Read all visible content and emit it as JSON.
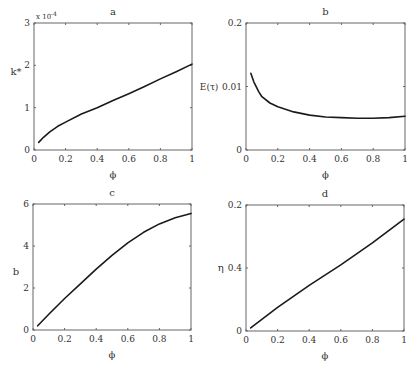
{
  "figure": {
    "width": 416,
    "height": 367,
    "background": "#ffffff",
    "line_color": "#1a1a1a",
    "axis_color": "#666666"
  },
  "chart_data": [
    {
      "id": "a",
      "type": "line",
      "title": "a",
      "xlabel": "ϕ",
      "ylabel": "k*",
      "y_multiplier_label": "x 10",
      "y_multiplier_exp": "-4",
      "xlim": [
        0,
        1
      ],
      "ylim": [
        0,
        3
      ],
      "xticks": [
        0,
        0.2,
        0.4,
        0.6,
        0.8,
        1
      ],
      "xtick_labels": [
        "0",
        "0.2",
        "0.4",
        "0.6",
        "0.8",
        "1"
      ],
      "yticks": [
        0,
        1,
        2,
        3
      ],
      "ytick_labels": [
        "0",
        "1",
        "2",
        "3"
      ],
      "frame": {
        "left": 34,
        "top": 23,
        "right": 192,
        "bottom": 150
      },
      "grid": false,
      "series": [
        {
          "name": "k*",
          "x": [
            0.03,
            0.06,
            0.1,
            0.15,
            0.2,
            0.3,
            0.4,
            0.5,
            0.6,
            0.7,
            0.8,
            0.9,
            1.0
          ],
          "y": [
            0.18,
            0.3,
            0.43,
            0.56,
            0.66,
            0.85,
            1.0,
            1.17,
            1.33,
            1.5,
            1.68,
            1.85,
            2.03
          ]
        }
      ]
    },
    {
      "id": "b",
      "type": "line",
      "title": "b",
      "xlabel": "ϕ",
      "ylabel": "E(τ)",
      "xlim": [
        0,
        1
      ],
      "ylim": [
        0,
        0.02
      ],
      "xticks": [
        0,
        0.2,
        0.4,
        0.6,
        0.8,
        1
      ],
      "xtick_labels": [
        "0",
        "0.2",
        "0.4",
        "0.6",
        "0.8",
        "1"
      ],
      "yticks": [
        0,
        0.01,
        0.02
      ],
      "ytick_labels": [
        "0",
        "0.01",
        "0.2"
      ],
      "frame": {
        "left": 246,
        "top": 23,
        "right": 405,
        "bottom": 150
      },
      "grid": false,
      "series": [
        {
          "name": "E(τ)",
          "x": [
            0.03,
            0.05,
            0.08,
            0.1,
            0.15,
            0.2,
            0.3,
            0.4,
            0.5,
            0.6,
            0.7,
            0.8,
            0.9,
            1.0
          ],
          "y": [
            0.0121,
            0.0107,
            0.0092,
            0.0084,
            0.0074,
            0.0068,
            0.006,
            0.0055,
            0.0052,
            0.0051,
            0.005,
            0.005,
            0.0051,
            0.0053
          ]
        }
      ]
    },
    {
      "id": "c",
      "type": "line",
      "title": "c",
      "xlabel": "ϕ",
      "ylabel": "b",
      "xlim": [
        0,
        1
      ],
      "ylim": [
        0,
        6
      ],
      "xticks": [
        0,
        0.2,
        0.4,
        0.6,
        0.8,
        1
      ],
      "xtick_labels": [
        "0",
        "0.2",
        "0.4",
        "0.6",
        "0.8",
        "1"
      ],
      "yticks": [
        0,
        2,
        4,
        6
      ],
      "ytick_labels": [
        "0",
        "2",
        "4",
        "6"
      ],
      "frame": {
        "left": 33,
        "top": 204,
        "right": 191,
        "bottom": 330
      },
      "grid": false,
      "series": [
        {
          "name": "b",
          "x": [
            0.03,
            0.1,
            0.2,
            0.3,
            0.4,
            0.5,
            0.6,
            0.7,
            0.8,
            0.9,
            1.0
          ],
          "y": [
            0.2,
            0.75,
            1.5,
            2.2,
            2.9,
            3.55,
            4.15,
            4.65,
            5.05,
            5.35,
            5.55
          ]
        }
      ]
    },
    {
      "id": "d",
      "type": "line",
      "title": "d",
      "xlabel": "ϕ",
      "ylabel": "η",
      "xlim": [
        0,
        1
      ],
      "ylim": [
        0,
        0.8
      ],
      "xticks": [
        0,
        0.2,
        0.4,
        0.6,
        0.8,
        1
      ],
      "xtick_labels": [
        "0",
        "0.2",
        "0.4",
        "0.6",
        "0.8",
        "1"
      ],
      "yticks": [
        0,
        0.4,
        0.8
      ],
      "ytick_labels": [
        "0",
        "0.4",
        "0.2"
      ],
      "frame": {
        "left": 246,
        "top": 205,
        "right": 404,
        "bottom": 331
      },
      "grid": false,
      "series": [
        {
          "name": "η",
          "x": [
            0.03,
            0.2,
            0.4,
            0.6,
            0.8,
            1.0
          ],
          "y": [
            0.02,
            0.15,
            0.29,
            0.42,
            0.56,
            0.71
          ]
        }
      ]
    }
  ]
}
